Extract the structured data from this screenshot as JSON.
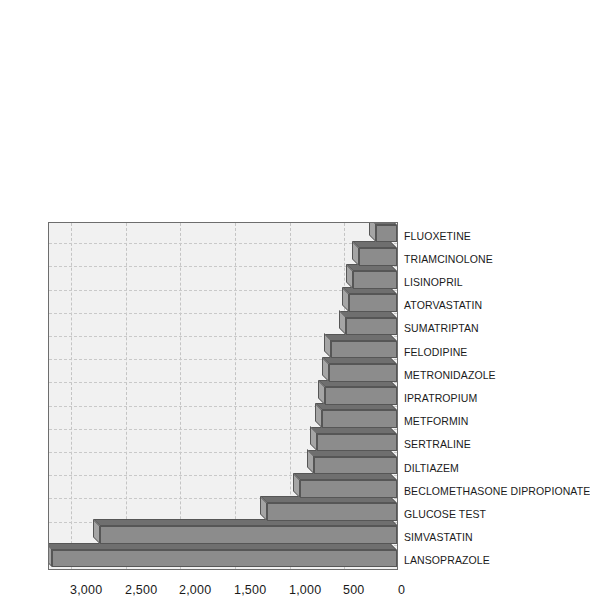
{
  "chart_data": {
    "type": "bar",
    "title": "",
    "subtitle": "",
    "xlabel": "",
    "ylabel": "",
    "orientation": "vertical-3d",
    "page_rotation_degrees": -90,
    "grid": true,
    "legend": false,
    "ylim": [
      0,
      3200
    ],
    "ytick_values": [
      0,
      500,
      1000,
      1500,
      2000,
      2500,
      3000
    ],
    "ytick_labels": [
      "0",
      "500",
      "1,000",
      "1,500",
      "2,000",
      "2,500",
      "3,000"
    ],
    "categories": [
      "LANSOPRAZOLE",
      "SIMVASTATIN",
      "GLUCOSE TEST",
      "BECLOMETHASONE DIPROPIONATE",
      "DILTIAZEM",
      "SERTRALINE",
      "METFORMIN",
      "IPRATROPIUM",
      "METRONIDAZOLE",
      "FELODIPINE",
      "SUMATRIPTAN",
      "ATORVASTATIN",
      "LISINOPRIL",
      "TRIAMCINOLONE",
      "FLUOXETINE"
    ],
    "values": [
      3150,
      2720,
      1185,
      890,
      755,
      730,
      685,
      655,
      620,
      605,
      465,
      440,
      400,
      350,
      190
    ],
    "colors": {
      "bar_front": "#8c8c8c",
      "bar_top": "#a5a5a5",
      "bar_side": "#6f6f6f",
      "bar_edge": "#565656",
      "plot_background": "#f1f1f1",
      "plot_border": "#6d6d6d",
      "gridline": "#c4c4c4",
      "text": "#1a1a1a",
      "figure_background": "#ffffff"
    }
  }
}
